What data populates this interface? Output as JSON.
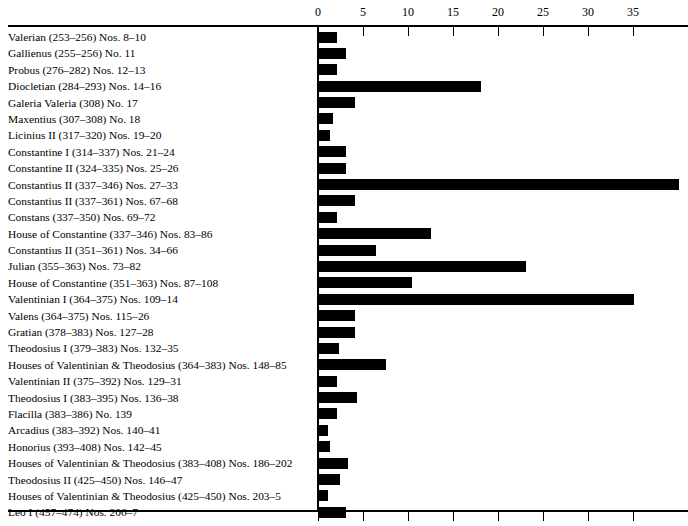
{
  "chart_data": {
    "type": "bar",
    "orientation": "horizontal",
    "title": "",
    "xlabel": "",
    "ylabel": "",
    "xlim": [
      0,
      41
    ],
    "grid": false,
    "legend": null,
    "axis_ticks": [
      0,
      5,
      10,
      15,
      20,
      25,
      30,
      35
    ],
    "bar_color": "#000000",
    "background_color": "#ffffff",
    "categories": [
      "Valerian (253–256) Nos. 8–10",
      "Gallienus (255–256) No. 11",
      "Probus (276–282) Nos. 12–13",
      "Diocletian (284–293) Nos. 14–16",
      "Galeria Valeria (308) No. 17",
      "Maxentius (307–308) No. 18",
      "Licinius II (317–320) Nos. 19–20",
      "Constantine I (314–337) Nos. 21–24",
      "Constantine II (324–335) Nos. 25–26",
      "Constantius II (337–346) Nos. 27–33",
      "Constantius II (337–361) Nos. 67–68",
      "Constans (337–350) Nos. 69–72",
      "House of Constantine (337–346) Nos. 83–86",
      "Constantius II (351–361) Nos. 34–66",
      "Julian (355–363) Nos. 73–82",
      "House of Constantine (351–363) Nos. 87–108",
      "Valentinian I (364–375) Nos. 109–14",
      "Valens (364–375) Nos. 115–26",
      "Gratian (378–383) Nos. 127–28",
      "Theodosius I (379–383) Nos. 132–35",
      "Houses of Valentinian & Theodosius (364–383) Nos. 148–85",
      "Valentinian II (375–392) Nos. 129–31",
      "Theodosius I (383–395) Nos. 136–38",
      "Flacilla (383–386) No. 139",
      "Arcadius (383–392) Nos. 140–41",
      "Honorius (393–408) Nos. 142–45",
      "Houses of Valentinian & Theodosius (383–408) Nos. 186–202",
      "Theodosius II (425–450) Nos. 146–47",
      "Houses of Valentinian & Theodosius (425–450) Nos. 203–5",
      "Leo I (457–474) Nos. 206–7"
    ],
    "values": [
      2,
      3,
      2,
      18,
      4,
      1.6,
      1.2,
      3,
      3,
      40,
      4,
      2,
      12.4,
      6.3,
      23,
      10.3,
      35,
      4,
      4,
      2.2,
      7.4,
      2,
      4.2,
      2,
      1,
      1.2,
      3.2,
      2.3,
      1,
      3
    ]
  }
}
